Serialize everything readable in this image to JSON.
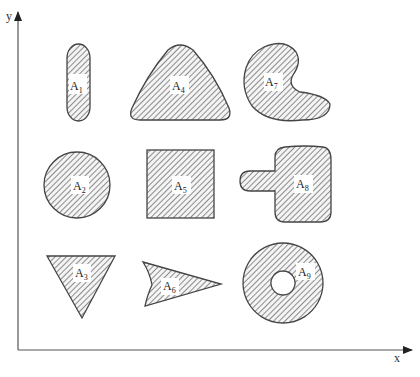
{
  "figure": {
    "axes": {
      "x_label": "x",
      "y_label": "y"
    },
    "hatch_color": "#555555",
    "outline_color": "#444444",
    "shapes": [
      {
        "id": "A1",
        "letter": "A",
        "sub": "1",
        "shape": "vertical rounded pill"
      },
      {
        "id": "A2",
        "letter": "A",
        "sub": "2",
        "shape": "circle"
      },
      {
        "id": "A3",
        "letter": "A",
        "sub": "3",
        "shape": "inverted triangle"
      },
      {
        "id": "A4",
        "letter": "A",
        "sub": "4",
        "shape": "rounded triangle"
      },
      {
        "id": "A5",
        "letter": "A",
        "sub": "5",
        "shape": "square"
      },
      {
        "id": "A6",
        "letter": "A",
        "sub": "6",
        "shape": "concave arrowhead"
      },
      {
        "id": "A7",
        "letter": "A",
        "sub": "7",
        "shape": "kidney"
      },
      {
        "id": "A8",
        "letter": "A",
        "sub": "8",
        "shape": "rounded square with tab"
      },
      {
        "id": "A9",
        "letter": "A",
        "sub": "9",
        "shape": "annulus"
      }
    ]
  }
}
